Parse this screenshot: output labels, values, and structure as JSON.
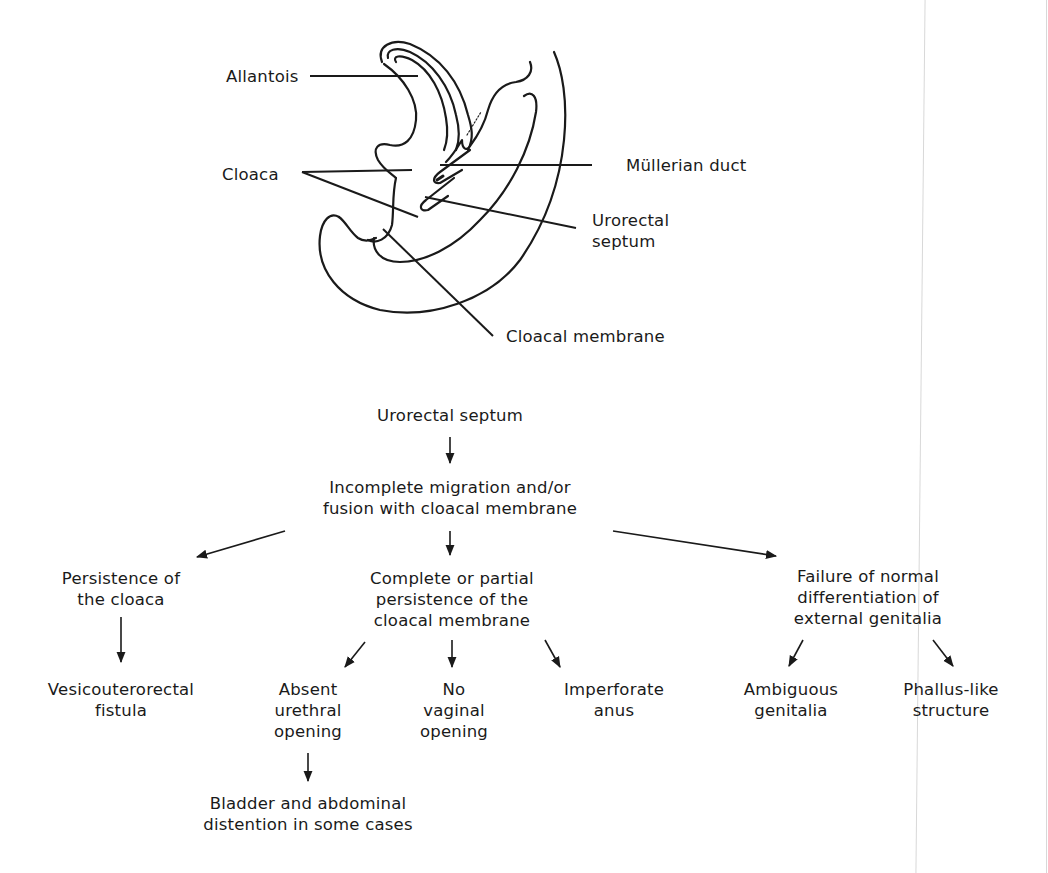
{
  "anatomy": {
    "labels": {
      "allantois": "Allantois",
      "cloaca": "Cloaca",
      "mullerian_duct": "Müllerian duct",
      "urorectal_septum": [
        "Urorectal",
        "septum"
      ],
      "cloacal_membrane": "Cloacal membrane"
    }
  },
  "flowchart": {
    "root": "Urorectal septum",
    "cause": [
      "Incomplete migration and/or",
      "fusion with cloacal membrane"
    ],
    "branches": [
      {
        "label": [
          "Persistence of",
          "the cloaca"
        ],
        "children": [
          {
            "label": [
              "Vesicouterorectal",
              "fistula"
            ]
          }
        ]
      },
      {
        "label": [
          "Complete or partial",
          "persistence of the",
          "cloacal membrane"
        ],
        "children": [
          {
            "label": [
              "Absent",
              "urethral",
              "opening"
            ],
            "children": [
              {
                "label": [
                  "Bladder and abdominal",
                  "distention in some cases"
                ]
              }
            ]
          },
          {
            "label": [
              "No",
              "vaginal",
              "opening"
            ]
          },
          {
            "label": [
              "Imperforate",
              "anus"
            ]
          }
        ]
      },
      {
        "label": [
          "Failure of normal",
          "differentiation of",
          "external genitalia"
        ],
        "children": [
          {
            "label": [
              "Ambiguous",
              "genitalia"
            ]
          },
          {
            "label": [
              "Phallus-like",
              "structure"
            ]
          }
        ]
      }
    ]
  },
  "colors": {
    "ink": "#1a1a1a",
    "background": "#ffffff",
    "scan_edge": "#d8d8d8"
  }
}
